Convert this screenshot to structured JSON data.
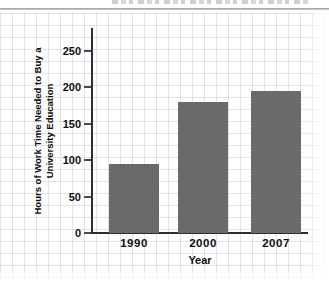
{
  "chart_data": {
    "type": "bar",
    "categories": [
      "1990",
      "2000",
      "2007"
    ],
    "values": [
      95,
      180,
      195
    ],
    "title": "",
    "xlabel": "Year",
    "ylabel": "Hours of Work Time Needed to Buy a University Education",
    "ylabel_line1": "Hours of Work Time Needed to Buy a",
    "ylabel_line2": "University Education",
    "ylim": [
      0,
      250
    ],
    "yticks": [
      0,
      50,
      100,
      150,
      200,
      250
    ],
    "legend": "none",
    "grid": "graph-paper page background",
    "bar_color": "#6a6a6a",
    "axis_color": "#2e2e2e"
  }
}
